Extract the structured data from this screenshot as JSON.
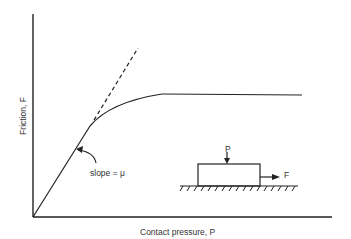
{
  "diagram": {
    "axes": {
      "x_label": "Contact pressure, P",
      "y_label": "Friction, F"
    },
    "annotations": {
      "slope": "slope = μ",
      "force_normal": "P",
      "force_tangential": "F"
    },
    "curves": [
      {
        "name": "linear region",
        "style": "solid"
      },
      {
        "name": "extrapolated linear",
        "style": "dashed"
      },
      {
        "name": "transition curve",
        "style": "solid"
      },
      {
        "name": "saturation plateau",
        "style": "solid"
      }
    ],
    "colors": {
      "line": "#222222",
      "background": "#ffffff"
    }
  }
}
